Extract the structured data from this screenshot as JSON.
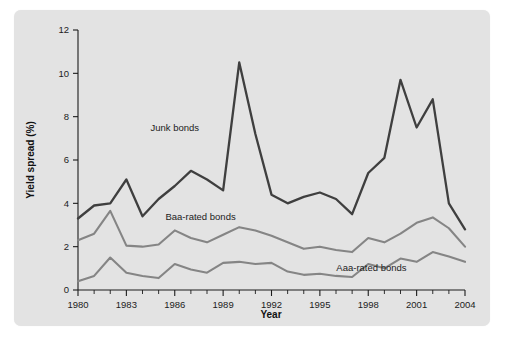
{
  "figure": {
    "panel_color": "#e3e3e3",
    "page_color": "#ffffff"
  },
  "chart_data": {
    "type": "line",
    "title": "",
    "xlabel": "Year",
    "ylabel": "Yield spread (%)",
    "xlim": [
      1980,
      2004
    ],
    "ylim": [
      0,
      12
    ],
    "grid": false,
    "legend_position": "inline-annotations",
    "x_tick_labels": [
      "1980",
      "1983",
      "1986",
      "1989",
      "1992",
      "1995",
      "1998",
      "2001",
      "2004"
    ],
    "x_tick_values": [
      1980,
      1983,
      1986,
      1989,
      1992,
      1995,
      1998,
      2001,
      2004
    ],
    "x_minor_ticks": [
      1981,
      1982,
      1984,
      1985,
      1987,
      1988,
      1990,
      1991,
      1993,
      1994,
      1996,
      1997,
      1999,
      2000,
      2002,
      2003
    ],
    "y_tick_labels": [
      "0",
      "2",
      "4",
      "6",
      "8",
      "10",
      "12"
    ],
    "y_tick_values": [
      0,
      2,
      4,
      6,
      8,
      10,
      12
    ],
    "x": [
      1980,
      1981,
      1982,
      1983,
      1984,
      1985,
      1986,
      1987,
      1988,
      1989,
      1990,
      1991,
      1992,
      1993,
      1994,
      1995,
      1996,
      1997,
      1998,
      1999,
      2000,
      2001,
      2002,
      2003,
      2004
    ],
    "series": [
      {
        "name": "Junk bonds",
        "color": "#3f3f3f",
        "width": 2.3,
        "label_x": 1986.0,
        "label_y": 7.35,
        "values": [
          3.3,
          3.9,
          4.0,
          5.1,
          3.4,
          4.2,
          4.8,
          5.5,
          5.1,
          4.6,
          10.5,
          7.2,
          4.4,
          4.0,
          4.3,
          4.5,
          4.2,
          3.5,
          5.4,
          6.1,
          9.7,
          7.5,
          8.8,
          4.0,
          2.8
        ]
      },
      {
        "name": "Baa-rated bonds",
        "color": "#858585",
        "width": 2.1,
        "label_x": 1987.6,
        "label_y": 3.25,
        "values": [
          2.3,
          2.6,
          3.65,
          2.05,
          2.0,
          2.1,
          2.75,
          2.4,
          2.2,
          2.55,
          2.9,
          2.75,
          2.5,
          2.2,
          1.9,
          2.0,
          1.85,
          1.75,
          2.4,
          2.2,
          2.6,
          3.1,
          3.35,
          2.85,
          2.0
        ]
      },
      {
        "name": "Aaa-rated bonds",
        "color": "#858585",
        "width": 2.1,
        "label_x": 1998.2,
        "label_y": 0.9,
        "values": [
          0.4,
          0.65,
          1.5,
          0.8,
          0.65,
          0.55,
          1.2,
          0.95,
          0.8,
          1.25,
          1.3,
          1.2,
          1.25,
          0.85,
          0.7,
          0.75,
          0.65,
          0.6,
          1.2,
          1.0,
          1.45,
          1.3,
          1.75,
          1.55,
          1.3
        ]
      }
    ]
  }
}
